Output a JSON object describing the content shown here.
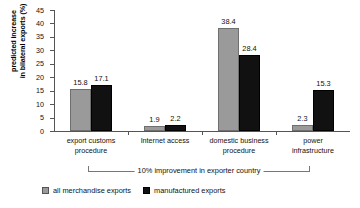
{
  "chart_data": {
    "type": "bar",
    "title": "",
    "xlabel": "",
    "ylabel": "predicted increase in bilateral exports (%)",
    "ylabel_line1": "predicted increase",
    "ylabel_line2": "in bilateral exports (%)",
    "ylim": [
      0,
      45
    ],
    "ytick_step": 5,
    "yticks": [
      "0",
      "5",
      "10",
      "15",
      "20",
      "25",
      "30",
      "35",
      "40",
      "45"
    ],
    "grid": false,
    "legend_position": "bottom-left",
    "categories": [
      "export customs procedure",
      "Internet access",
      "domestic business procedure",
      "power infrastructure"
    ],
    "category_lines": [
      [
        "export customs",
        "procedure"
      ],
      [
        "Internet access",
        ""
      ],
      [
        "domestic business",
        "procedure"
      ],
      [
        "power",
        "infrastructure"
      ]
    ],
    "series": [
      {
        "name": "all merchandise exports",
        "color": "#9a9a9a",
        "values": [
          15.8,
          1.9,
          38.4,
          2.3
        ],
        "labels": [
          "15.8",
          "1.9",
          "38.4",
          "2.3"
        ]
      },
      {
        "name": "manufactured exports",
        "color": "#111111",
        "values": [
          17.1,
          2.2,
          28.4,
          15.3
        ],
        "labels": [
          "17.1",
          "2.2",
          "28.4",
          "15.3"
        ]
      }
    ],
    "annotation": "10% improvement in exporter country"
  },
  "legend": {
    "items": [
      {
        "label": "all merchandise exports",
        "swatch": "gray-swatch"
      },
      {
        "label": "manufactured exports",
        "swatch": "black-swatch"
      }
    ]
  }
}
